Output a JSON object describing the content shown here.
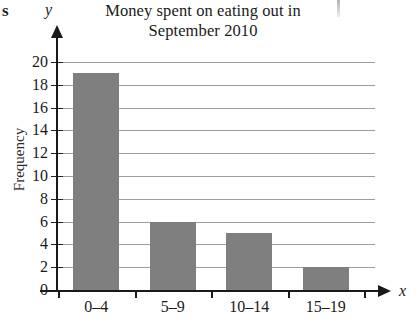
{
  "artifacts": {
    "corner_letter": "s"
  },
  "chart_data": {
    "type": "bar",
    "title": "Money spent on eating out in September 2010",
    "title_line1": "Money spent on eating out in",
    "title_line2": "September 2010",
    "categories": [
      "0–4",
      "5–9",
      "10–14",
      "15–19"
    ],
    "values": [
      19,
      6,
      5,
      2
    ],
    "xlabel": "x",
    "ylabel": "Frequency",
    "y_axis_symbol": "y",
    "x_axis_symbol": "x",
    "ylim": [
      0,
      20
    ],
    "ytick_labels": [
      "0",
      "2",
      "4",
      "6",
      "8",
      "10",
      "12",
      "14",
      "16",
      "18",
      "20"
    ],
    "ytick_values": [
      0,
      2,
      4,
      6,
      8,
      10,
      12,
      14,
      16,
      18,
      20
    ],
    "grid": true,
    "legend": false,
    "bar_color": "#7f7f7f",
    "axis_color": "#1a1a1a",
    "grid_color": "#8d8d8d",
    "background": "#ffffff"
  }
}
